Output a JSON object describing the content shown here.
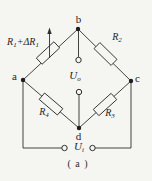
{
  "diagram": {
    "type": "wheatstone-bridge-circuit",
    "caption": "( a )",
    "nodes": {
      "top": "b",
      "left": "a",
      "right": "c",
      "bottom": "d"
    },
    "resistors": {
      "r1": {
        "base1": "R",
        "sub1": "1",
        "mid": "+ΔR",
        "sub2": "1"
      },
      "r2": {
        "base": "R",
        "sub": "2"
      },
      "r3": {
        "base": "R",
        "sub": "3"
      },
      "r4": {
        "base": "R",
        "sub": "4"
      }
    },
    "voltages": {
      "output": {
        "base": "U",
        "sub": "o"
      },
      "input": {
        "base": "U",
        "sub": "i"
      }
    },
    "colors": {
      "line": "#2f2f2f",
      "background": "#f5f5f2"
    }
  }
}
